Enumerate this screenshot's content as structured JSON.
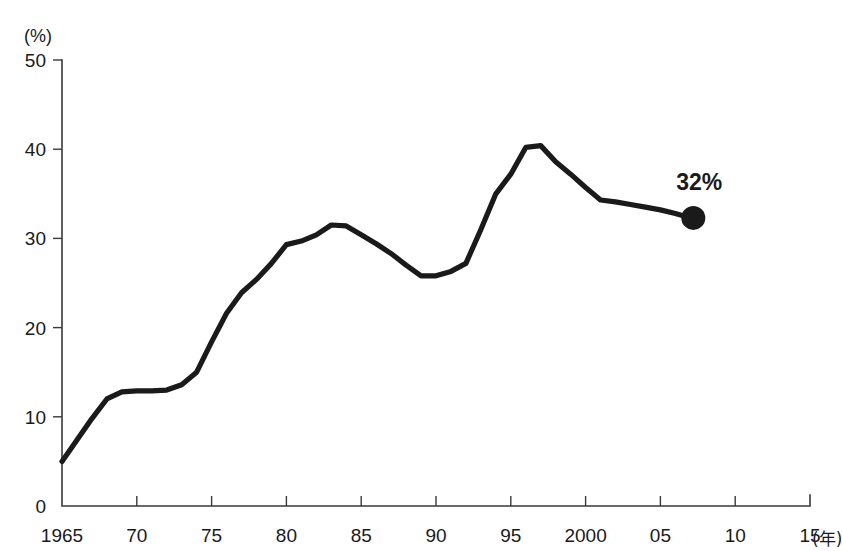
{
  "figure": {
    "truncated_title": "",
    "y_unit_label": "(%)",
    "x_unit_label": "(年)",
    "annotation_label": "32%"
  },
  "chart_data": {
    "type": "line",
    "title": "",
    "subtitle": "",
    "xlabel": "(年)",
    "ylabel": "(%)",
    "xlim": [
      1965,
      2015
    ],
    "ylim": [
      0,
      50
    ],
    "grid": false,
    "legend": "none",
    "x_tick_labels": [
      "1965",
      "70",
      "75",
      "80",
      "85",
      "90",
      "95",
      "2000",
      "05",
      "10",
      "15"
    ],
    "x_tick_values": [
      1965,
      1970,
      1975,
      1980,
      1985,
      1990,
      1995,
      2000,
      2005,
      2010,
      2015
    ],
    "y_tick_labels": [
      "0",
      "10",
      "20",
      "30",
      "40",
      "50"
    ],
    "y_tick_values": [
      0,
      10,
      20,
      30,
      40,
      50
    ],
    "series": [
      {
        "name": "percentage",
        "x": [
          1965,
          1966,
          1967,
          1968,
          1969,
          1970,
          1971,
          1972,
          1973,
          1974,
          1975,
          1976,
          1977,
          1978,
          1979,
          1980,
          1981,
          1982,
          1983,
          1984,
          1985,
          1986,
          1987,
          1988,
          1989,
          1990,
          1991,
          1992,
          1993,
          1994,
          1995,
          1996,
          1997,
          1998,
          1999,
          2000,
          2001,
          2002,
          2003,
          2004,
          2005,
          2006,
          2007
        ],
        "values": [
          5.0,
          7.4,
          9.8,
          12.0,
          12.8,
          12.9,
          12.9,
          13.0,
          13.6,
          15.0,
          18.4,
          21.6,
          23.9,
          25.4,
          27.2,
          29.3,
          29.7,
          30.4,
          31.5,
          31.4,
          30.4,
          29.4,
          28.3,
          27.0,
          25.8,
          25.8,
          26.3,
          27.2,
          31.0,
          35.0,
          37.2,
          40.2,
          40.4,
          38.6,
          37.2,
          35.7,
          34.3,
          34.1,
          33.8,
          33.5,
          33.2,
          32.8,
          32.3
        ]
      }
    ],
    "annotations": [
      {
        "label": "32%",
        "x": 2007.2,
        "y": 32.3,
        "marker": "filled-circle"
      }
    ]
  }
}
